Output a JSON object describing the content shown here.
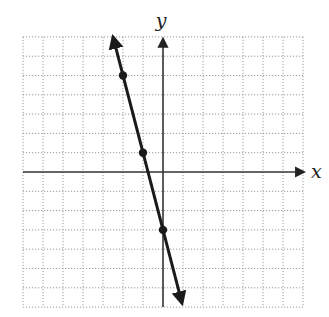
{
  "chart_data": {
    "type": "line",
    "title": "",
    "xlabel": "x",
    "ylabel": "y",
    "xlim": [
      -7,
      7
    ],
    "ylim": [
      -7,
      7
    ],
    "grid": true,
    "grid_style": "dotted",
    "tick_labels": false,
    "series": [
      {
        "name": "y = -4x - 3",
        "equation": "y = -4x - 3",
        "slope": -4,
        "intercept": -3,
        "arrows_both_ends": true,
        "segment": {
          "start": [
            -2.5,
            7
          ],
          "end": [
            0.95,
            -6.8
          ]
        },
        "points": [
          {
            "x": -2,
            "y": 5
          },
          {
            "x": -1,
            "y": 1
          },
          {
            "x": 0,
            "y": -3
          }
        ]
      }
    ]
  },
  "labels": {
    "x_axis": "x",
    "y_axis": "y"
  },
  "colors": {
    "line": "#1a1a1a",
    "axis": "#333333",
    "grid": "#9a9a9a",
    "background": "#ffffff"
  }
}
